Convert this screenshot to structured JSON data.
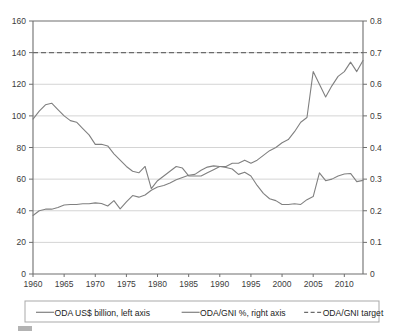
{
  "chart_data": {
    "type": "line",
    "title": "",
    "subtitle": "",
    "xlabel": "",
    "ylabel": "",
    "y2label": "",
    "grid": true,
    "legend_position": "bottom",
    "xlim": [
      1960,
      2013
    ],
    "ylim": [
      0,
      160
    ],
    "y2lim": [
      0,
      0.8
    ],
    "xticks": [
      1960,
      1965,
      1970,
      1975,
      1980,
      1985,
      1990,
      1995,
      2000,
      2005,
      2010
    ],
    "xtick_labels": [
      "1960",
      "1965",
      "1970",
      "1975",
      "1980",
      "1985",
      "1990",
      "1995",
      "2000",
      "2005",
      "2010"
    ],
    "yticks": [
      0,
      20,
      40,
      60,
      80,
      100,
      120,
      140,
      160
    ],
    "ytick_labels": [
      "0",
      "20",
      "40",
      "60",
      "80",
      "100",
      "120",
      "140",
      "160"
    ],
    "y2ticks": [
      0,
      0.1,
      0.2,
      0.3,
      0.4,
      0.5,
      0.6,
      0.7,
      0.8
    ],
    "y2tick_labels": [
      "0",
      "0.1",
      "0.2",
      "0.3",
      "0.4",
      "0.5",
      "0.6",
      "0.7",
      "0.8"
    ],
    "x": [
      1960,
      1961,
      1962,
      1963,
      1964,
      1965,
      1966,
      1967,
      1968,
      1969,
      1970,
      1971,
      1972,
      1973,
      1974,
      1975,
      1976,
      1977,
      1978,
      1979,
      1980,
      1981,
      1982,
      1983,
      1984,
      1985,
      1986,
      1987,
      1988,
      1989,
      1990,
      1991,
      1992,
      1993,
      1994,
      1995,
      1996,
      1997,
      1998,
      1999,
      2000,
      2001,
      2002,
      2003,
      2004,
      2005,
      2006,
      2007,
      2008,
      2009,
      2010,
      2011,
      2012,
      2013
    ],
    "series": [
      {
        "name": "ODA US$ billion, left axis",
        "axis": "left",
        "style": "solid",
        "color": "#808080",
        "values": [
          98,
          103,
          107,
          108,
          104,
          100,
          97,
          96,
          92,
          88,
          82,
          82,
          81,
          76,
          72,
          68,
          65,
          64,
          68,
          54,
          59,
          62,
          65,
          68,
          67,
          62,
          62,
          62,
          64,
          66,
          68,
          68,
          70,
          70,
          72,
          70,
          72,
          75,
          78,
          80,
          83,
          85,
          90,
          96,
          99,
          128,
          120,
          112,
          119,
          125,
          128,
          134,
          128,
          135
        ]
      },
      {
        "name": "ODA/GNI %, right axis",
        "axis": "right",
        "style": "solid",
        "color": "#808080",
        "values": [
          0.185,
          0.2,
          0.205,
          0.205,
          0.21,
          0.218,
          0.22,
          0.22,
          0.222,
          0.222,
          0.225,
          0.223,
          0.215,
          0.232,
          0.206,
          0.228,
          0.248,
          0.243,
          0.25,
          0.265,
          0.275,
          0.28,
          0.288,
          0.298,
          0.305,
          0.312,
          0.315,
          0.328,
          0.338,
          0.342,
          0.34,
          0.337,
          0.332,
          0.315,
          0.322,
          0.31,
          0.28,
          0.255,
          0.238,
          0.232,
          0.22,
          0.22,
          0.222,
          0.22,
          0.235,
          0.245,
          0.32,
          0.295,
          0.3,
          0.31,
          0.316,
          0.318,
          0.292,
          0.296
        ]
      },
      {
        "name": "ODA/GNI target",
        "axis": "right",
        "style": "dashed",
        "color": "#6b6b6b",
        "constant_value": 0.7,
        "left_axis_equivalent": 140
      }
    ],
    "legend": [
      {
        "label": "ODA US$ billion, left axis",
        "style": "solid"
      },
      {
        "label": "ODA/GNI %, right axis",
        "style": "solid"
      },
      {
        "label": "ODA/GNI target",
        "style": "dashed"
      }
    ],
    "annotations": []
  }
}
